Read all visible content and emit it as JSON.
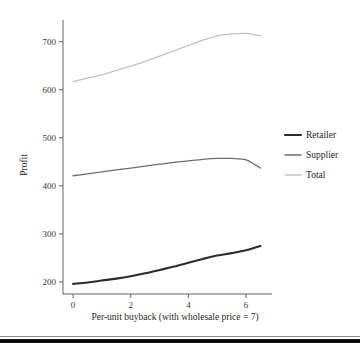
{
  "chart_data": {
    "type": "line",
    "title": "",
    "xlabel": "Per-unit buyback (with wholesale price = 7)",
    "ylabel": "Profit",
    "xlim": [
      -0.35,
      6.9
    ],
    "ylim": [
      175,
      745
    ],
    "xticks": [
      0,
      2,
      4,
      6
    ],
    "xtick_labels": [
      "0",
      "2",
      "4",
      "6"
    ],
    "yticks": [
      200,
      300,
      400,
      500,
      600,
      700
    ],
    "ytick_labels": [
      "200",
      "300",
      "400",
      "500",
      "600",
      "700"
    ],
    "grid": false,
    "legend_position": "right",
    "x": [
      0,
      0.5,
      1,
      1.5,
      2,
      2.5,
      3,
      3.5,
      4,
      4.5,
      5,
      5.5,
      6,
      6.5
    ],
    "series": [
      {
        "name": "Retailer",
        "color": "#2b2b2b",
        "width": 2.1,
        "values": [
          196,
          199,
          203,
          207,
          212,
          218,
          225,
          232,
          240,
          248,
          255,
          260,
          266,
          275
        ]
      },
      {
        "name": "Supplier",
        "color": "#6e6e6e",
        "width": 1.3,
        "values": [
          421,
          425,
          429,
          433,
          437,
          441,
          445,
          449,
          452,
          455,
          457,
          457,
          454,
          437
        ]
      },
      {
        "name": "Total",
        "color": "#c2c2c2",
        "width": 1.3,
        "values": [
          617,
          624,
          631,
          640,
          649,
          659,
          670,
          681,
          692,
          703,
          712,
          716,
          717,
          712
        ]
      }
    ]
  },
  "legend": {
    "items": [
      {
        "label": "Retailer"
      },
      {
        "label": "Supplier"
      },
      {
        "label": "Total"
      }
    ]
  }
}
